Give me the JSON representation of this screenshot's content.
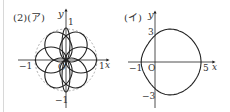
{
  "left_figure": {
    "label": "(2)(ア)",
    "y_axis_label": "y",
    "x_axis_label": "x",
    "origin_label": "O",
    "tick_top": "1",
    "tick_bottom": "−1",
    "tick_left": "−1",
    "tick_right": "1",
    "unit_circle": "dashed",
    "curve": "rose with six round petals and two narrow vertical petals"
  },
  "right_figure": {
    "label": "(イ)",
    "y_axis_label": "y",
    "x_axis_label": "x",
    "origin_label": "O",
    "tick_top": "3",
    "tick_bottom": "−3",
    "tick_left": "−1",
    "tick_right": "5",
    "curve": "closed limaçon-like curve with dimple at x=−1"
  },
  "colors": {
    "stroke": "#222222",
    "dashed": "#999999",
    "edge": "#d8d8d8"
  }
}
